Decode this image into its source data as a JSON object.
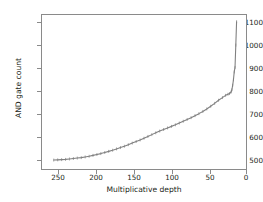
{
  "chart_data": {
    "type": "line",
    "title": "",
    "xlabel": "Multiplicative depth",
    "ylabel": "AND gate count",
    "xlim": [
      260,
      0
    ],
    "ylim": [
      470,
      1160
    ],
    "x_inverted": true,
    "grid": false,
    "legend": "none",
    "line_color": "#808080",
    "marker": "tick",
    "xticks": [
      250,
      200,
      150,
      100,
      50,
      0
    ],
    "xtick_labels": [
      "250",
      "200",
      "150",
      "100",
      "50",
      "0"
    ],
    "yticks": [
      500,
      600,
      700,
      800,
      900,
      1000,
      1100
    ],
    "ytick_labels": [
      "500",
      "600",
      "700",
      "800",
      "900",
      "1000",
      "1100"
    ],
    "series": [
      {
        "name": "AND gate count vs multiplicative depth",
        "x": [
          245,
          240,
          235,
          230,
          225,
          220,
          215,
          210,
          205,
          200,
          195,
          190,
          185,
          180,
          175,
          170,
          165,
          160,
          155,
          150,
          145,
          140,
          135,
          130,
          125,
          120,
          115,
          110,
          105,
          100,
          95,
          90,
          85,
          80,
          75,
          70,
          65,
          60,
          55,
          50,
          45,
          40,
          35,
          30,
          26,
          23,
          21,
          19,
          18,
          17,
          16,
          15,
          14,
          13,
          12
        ],
        "y": [
          510,
          511,
          512,
          513,
          515,
          517,
          519,
          521,
          524,
          527,
          531,
          535,
          539,
          544,
          549,
          554,
          560,
          566,
          572,
          579,
          586,
          593,
          600,
          608,
          616,
          624,
          632,
          640,
          647,
          654,
          661,
          668,
          676,
          684,
          692,
          700,
          709,
          718,
          728,
          739,
          751,
          764,
          778,
          790,
          800,
          805,
          808,
          815,
          825,
          845,
          870,
          905,
          925,
          1025,
          1130
        ]
      }
    ]
  },
  "axes": {
    "y_tick_positions_px": [
      22,
      45,
      68,
      91,
      114,
      137,
      160
    ],
    "x_tick_positions_px": [
      58,
      96,
      134,
      172,
      210,
      246
    ]
  }
}
